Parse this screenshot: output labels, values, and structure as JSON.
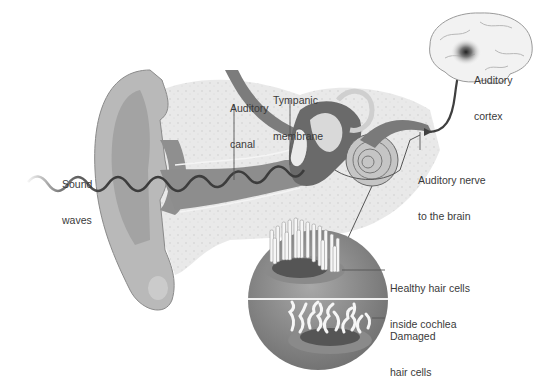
{
  "diagram": {
    "colors": {
      "background": "#ffffff",
      "label_text": "#3a3a3a",
      "ear_skin": "#b8b8b8",
      "ear_inner": "#9a9a9a",
      "bone": "#e6e6e6",
      "wave": "#3c3c3c",
      "nerve": "#444444",
      "cochlea_disc": "#8f8f8f",
      "hair_cell": "#f4f4f4"
    },
    "labels": {
      "sound_waves": {
        "line1": "Sound",
        "line2": "waves"
      },
      "auditory_canal": {
        "line1": "Auditory",
        "line2": "canal"
      },
      "tympanic_membrane": {
        "line1": "Tympanic",
        "line2": "membrane"
      },
      "auditory_cortex": {
        "line1": "Auditory",
        "line2": "cortex"
      },
      "auditory_nerve": {
        "line1": "Auditory nerve",
        "line2": "to the brain"
      },
      "healthy_hair_cells": {
        "line1": "Healthy hair cells",
        "line2": "inside cochlea"
      },
      "damaged_hair_cells": {
        "line1": "Damaged",
        "line2": "hair cells"
      }
    },
    "icons": [
      "outer-ear-icon",
      "brain-icon",
      "cochlea-icon",
      "sound-wave-icon",
      "hair-cells-inset-icon"
    ]
  }
}
